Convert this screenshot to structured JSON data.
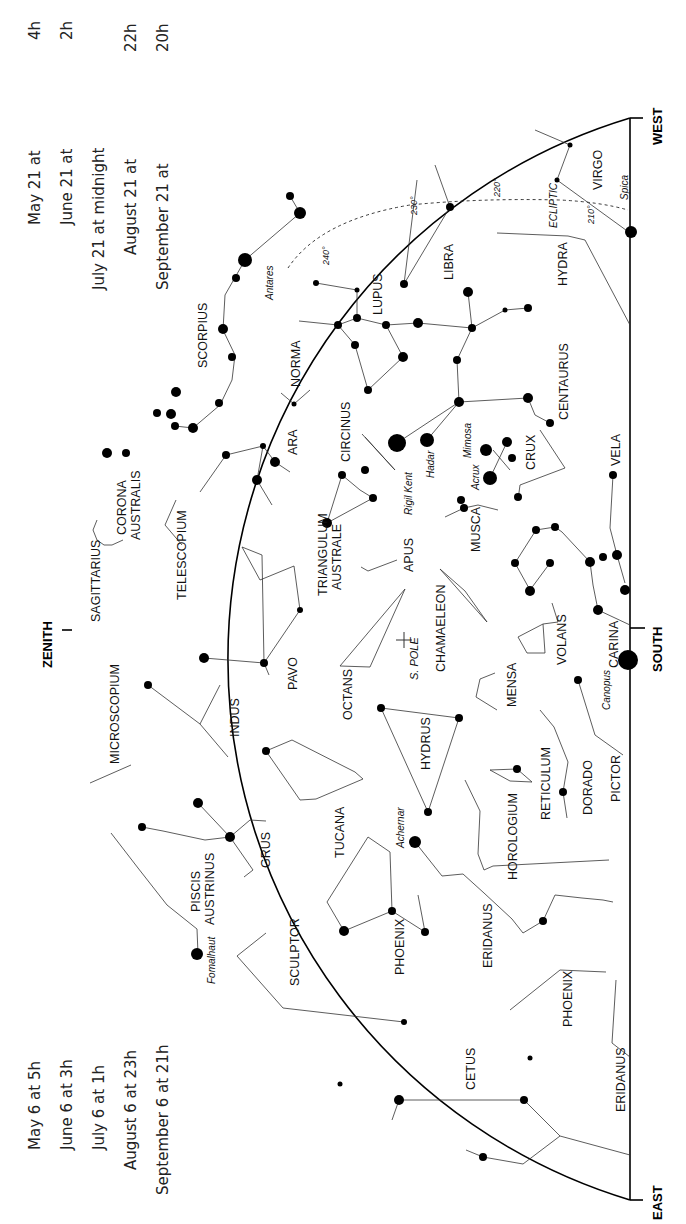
{
  "times_top": [
    {
      "date": "May 21 at",
      "hour": "4h"
    },
    {
      "date": "June 21 at",
      "hour": "2h"
    },
    {
      "date": "July 21 at midnight",
      "hour": ""
    },
    {
      "date": "August 21 at",
      "hour": "22h"
    },
    {
      "date": "September 21 at",
      "hour": "20h"
    }
  ],
  "times_bottom": [
    {
      "text": "May 6 at  5h"
    },
    {
      "text": "June 6 at  3h"
    },
    {
      "text": "July 6 at  1h"
    },
    {
      "text": "August 6 at 23h"
    },
    {
      "text": "September 6 at 21h"
    }
  ],
  "directions": {
    "west": "WEST",
    "east": "EAST",
    "south": "SOUTH",
    "zenith": "ZENITH"
  },
  "ecliptic": {
    "label": "ECLIPTIC",
    "marks": [
      "210°",
      "220°",
      "230°",
      "240°"
    ]
  },
  "pole": {
    "label": "S. POLE"
  },
  "constellations": [
    "VIRGO",
    "LIBRA",
    "HYDRA",
    "LUPUS",
    "SCORPIUS",
    "NORMA",
    "CENTAURUS",
    "CIRCINUS",
    "CRUX",
    "ARA",
    "VELA",
    "CORONA AUSTRALIS",
    "TELESCOPIUM",
    "TRIANGULUM AUSTRALE",
    "MUSCA",
    "SAGITTARIUS",
    "APUS",
    "CHAMAELEON",
    "CARINA",
    "VOLANS",
    "MICROSCOPIUM",
    "PAVO",
    "OCTANS",
    "MENSA",
    "INDUS",
    "HYDRUS",
    "PICTOR",
    "DORADO",
    "RETICULUM",
    "GRUS",
    "TUCANA",
    "HOROLOGIUM",
    "PISCIS AUSTRINUS",
    "PHOENIX",
    "ERIDANUS",
    "SCULPTOR",
    "CETUS"
  ],
  "bright_stars": [
    "Spica",
    "Antares",
    "Rigil Kent",
    "Hadar",
    "Mimosa",
    "Acrux",
    "Canopus",
    "Achernar",
    "Fomalhaut"
  ],
  "labels": {
    "virgo": "VIRGO",
    "libra": "LIBRA",
    "hydra": "HYDRA",
    "lupus": "LUPUS",
    "scorpius": "SCORPIUS",
    "norma": "NORMA",
    "centaurus": "CENTAURUS",
    "circinus": "CIRCINUS",
    "crux": "CRUX",
    "ara": "ARA",
    "vela": "VELA",
    "corona1": "CORONA",
    "corona2": "AUSTRALIS",
    "telescopium": "TELESCOPIUM",
    "triangulum1": "TRIANGULUM",
    "triangulum2": "AUSTRALE",
    "musca": "MUSCA",
    "sagittarius": "SAGITTARIUS",
    "apus": "APUS",
    "chamaeleon": "CHAMAELEON",
    "carina": "CARINA",
    "volans": "VOLANS",
    "microscopium": "MICROSCOPIUM",
    "pavo": "PAVO",
    "octans": "OCTANS",
    "mensa": "MENSA",
    "indus": "INDUS",
    "hydrus": "HYDRUS",
    "pictor": "PICTOR",
    "dorado": "DORADO",
    "reticulum": "RETICULUM",
    "grus": "GRUS",
    "tucana": "TUCANA",
    "horologium": "HOROLOGIUM",
    "piscis1": "PISCIS",
    "piscis2": "AUSTRINUS",
    "phoenix": "PHOENIX",
    "phoenix2": "PHOENIX",
    "eridanus": "ERIDANUS",
    "eridanus2": "ERIDANUS",
    "sculptor": "SCULPTOR",
    "cetus": "CETUS"
  },
  "stars": {
    "spica": "Spica",
    "antares": "Antares",
    "rigil": "Rigil Kent",
    "hadar": "Hadar",
    "mimosa": "Mimosa",
    "acrux": "Acrux",
    "canopus": "Canopus",
    "achernar": "Achernar",
    "fomalhaut": "Fomalhaut"
  }
}
